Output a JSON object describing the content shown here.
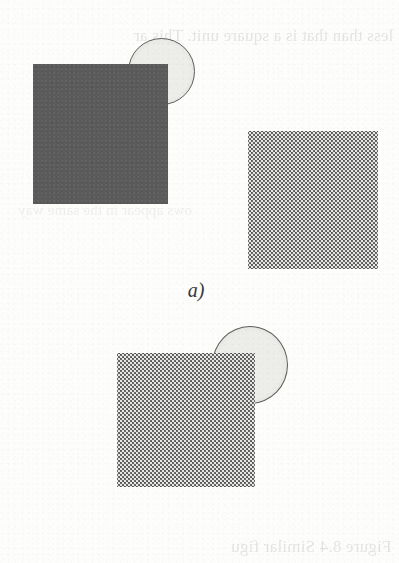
{
  "figure": {
    "type": "diagram",
    "background_color": "#fdfdfc",
    "panels": [
      {
        "id": "a",
        "caption": "a)",
        "shapes": [
          {
            "name": "circle",
            "kind": "circle",
            "fill": "#ededea",
            "stroke": "#5d5d5d",
            "x": 128,
            "y": 38,
            "width": 68,
            "height": 68,
            "z": 5
          },
          {
            "name": "solid-square",
            "kind": "square",
            "fill": "#5b5b5b",
            "pattern": "solid",
            "x": 33,
            "y": 64,
            "width": 135,
            "height": 140,
            "z": 10
          },
          {
            "name": "dotted-square",
            "kind": "square",
            "fill": "#6a6a6a",
            "pattern": "dotted-halftone",
            "x": 248,
            "y": 131,
            "width": 130,
            "height": 138,
            "z": 10
          }
        ]
      },
      {
        "id": "b",
        "caption": "b)",
        "shapes": [
          {
            "name": "circle",
            "kind": "circle",
            "fill": "#ededea",
            "stroke": "#5d5d5d",
            "x": 212,
            "y": 326,
            "width": 76,
            "height": 79,
            "z": 5
          },
          {
            "name": "dotted-square",
            "kind": "square",
            "fill": "#6a6a6a",
            "pattern": "dotted-halftone",
            "x": 117,
            "y": 353,
            "width": 138,
            "height": 134,
            "z": 10
          }
        ]
      }
    ]
  },
  "bleed_through": {
    "note": "faint mirrored show-through text from the reverse side of the printed page",
    "top": "less than that is a square unit. This ar",
    "middle": "ows appear in the same way",
    "bottom_line1": "Figure 8.4 Similar figu",
    "bottom_line2": "two cell cases on the sq"
  }
}
